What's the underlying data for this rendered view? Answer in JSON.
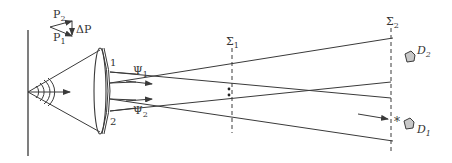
{
  "diagram": {
    "type": "optical-interferometry-schematic",
    "labels": {
      "p1": "P",
      "p1_sub": "1",
      "p2": "P",
      "p2_sub": "2",
      "delta_p": "ΔP",
      "beam1_port": "1",
      "beam2_port": "2",
      "psi1": "Ψ",
      "psi1_sub": "1",
      "psi2": "Ψ",
      "psi2_sub": "2",
      "sigma1": "Σ",
      "sigma1_sub": "1",
      "sigma2": "Σ",
      "sigma2_sub": "2",
      "d1": "D",
      "d1_sub": "1",
      "d2": "D",
      "d2_sub": "2",
      "star": "*"
    },
    "colors": {
      "line": "#3a3a3a",
      "detector_fill": "#c8c8c8",
      "background": "#ffffff"
    }
  }
}
